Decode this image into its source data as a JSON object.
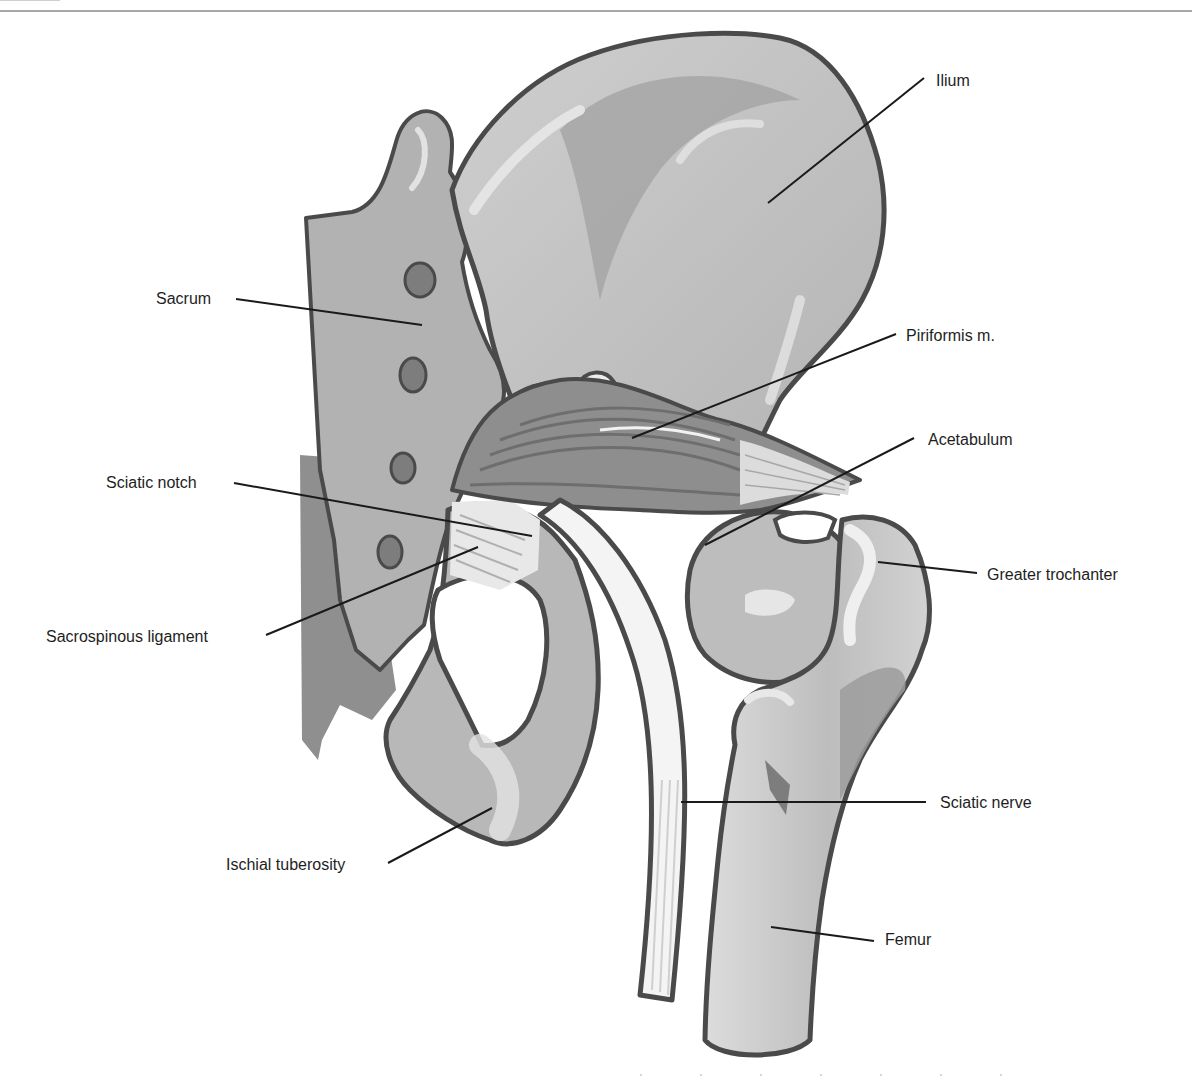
{
  "figure": {
    "type": "anatomical-illustration",
    "colors": {
      "outline": "#4a4a4a",
      "bone_light": "#c9c9c9",
      "bone_mid": "#a9a9a9",
      "bone_dark": "#8a8a8a",
      "highlight": "#e6e6e6",
      "muscle": "#8c8c8c",
      "nerve": "#f0f0f0",
      "leader_line": "#1a1a1a",
      "label_text": "#1e1e1e"
    }
  },
  "labels": [
    {
      "id": "ilium",
      "text": "Ilium",
      "x": 936,
      "y": 72
    },
    {
      "id": "sacrum",
      "text": "Sacrum",
      "x": 156,
      "y": 290
    },
    {
      "id": "piriformis",
      "text": "Piriformis m.",
      "x": 906,
      "y": 327
    },
    {
      "id": "acetabulum",
      "text": "Acetabulum",
      "x": 928,
      "y": 431
    },
    {
      "id": "sciatic-notch",
      "text": "Sciatic notch",
      "x": 106,
      "y": 474
    },
    {
      "id": "greater-trochanter",
      "text": "Greater trochanter",
      "x": 987,
      "y": 566
    },
    {
      "id": "sacrospinous-ligament",
      "text": "Sacrospinous ligament",
      "x": 46,
      "y": 628
    },
    {
      "id": "sciatic-nerve",
      "text": "Sciatic nerve",
      "x": 940,
      "y": 794
    },
    {
      "id": "ischial-tuberosity",
      "text": "Ischial tuberosity",
      "x": 226,
      "y": 856
    },
    {
      "id": "femur",
      "text": "Femur",
      "x": 885,
      "y": 931
    }
  ],
  "leader_lines": [
    {
      "id": "ilium",
      "x1": 924,
      "y1": 78,
      "x2": 768,
      "y2": 203
    },
    {
      "id": "sacrum",
      "x1": 236,
      "y1": 299,
      "x2": 422,
      "y2": 325
    },
    {
      "id": "piriformis",
      "x1": 896,
      "y1": 334,
      "x2": 632,
      "y2": 438
    },
    {
      "id": "acetabulum",
      "x1": 914,
      "y1": 438,
      "x2": 705,
      "y2": 545
    },
    {
      "id": "sciatic-notch",
      "x1": 234,
      "y1": 483,
      "x2": 532,
      "y2": 536
    },
    {
      "id": "greater-trochanter",
      "x1": 977,
      "y1": 573,
      "x2": 878,
      "y2": 562
    },
    {
      "id": "sacrospinous-ligament",
      "x1": 266,
      "y1": 635,
      "x2": 478,
      "y2": 547
    },
    {
      "id": "sciatic-nerve",
      "x1": 926,
      "y1": 802,
      "x2": 681,
      "y2": 802
    },
    {
      "id": "ischial-tuberosity",
      "x1": 388,
      "y1": 863,
      "x2": 492,
      "y2": 808
    },
    {
      "id": "femur",
      "x1": 874,
      "y1": 941,
      "x2": 771,
      "y2": 927
    }
  ]
}
